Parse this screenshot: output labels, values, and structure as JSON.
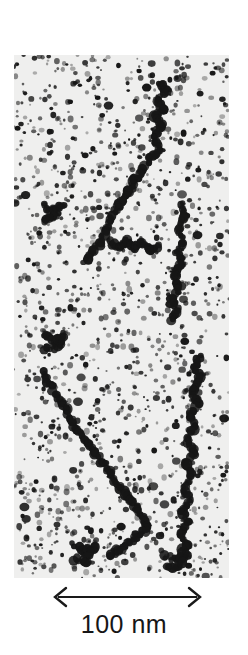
{
  "figure": {
    "kind": "electron-micrograph",
    "panel": {
      "x": 14,
      "y": 55,
      "width": 215,
      "height": 523,
      "background_color": "#efefee",
      "particle_color": "#161616"
    }
  },
  "scale_bar": {
    "label": "100 nm",
    "length_px": 155,
    "arrow_style": "double-headed",
    "color": "#1a1a1a",
    "x": 50,
    "y": 584
  },
  "chart_data": {
    "type": "scatter",
    "title": "",
    "xlabel": "",
    "ylabel": "",
    "grid": false,
    "legend": false,
    "scale_bar_label": "100 nm",
    "scale_bar_length_px": 155,
    "panel_width_px": 215,
    "panel_height_px": 523,
    "nm_per_px": 0.645,
    "filaments": [
      {
        "name": "filament-upper-right",
        "points": [
          [
            145,
            28
          ],
          [
            152,
            36
          ],
          [
            143,
            45
          ],
          [
            150,
            54
          ],
          [
            141,
            62
          ],
          [
            148,
            72
          ],
          [
            139,
            83
          ],
          [
            146,
            94
          ],
          [
            136,
            104
          ],
          [
            128,
            116
          ],
          [
            120,
            128
          ],
          [
            112,
            140
          ],
          [
            104,
            152
          ],
          [
            98,
            164
          ],
          [
            92,
            176
          ],
          [
            86,
            188
          ],
          [
            78,
            198
          ],
          [
            70,
            208
          ]
        ]
      },
      {
        "name": "filament-mid-right",
        "points": [
          [
            168,
            150
          ],
          [
            172,
            162
          ],
          [
            165,
            174
          ],
          [
            170,
            186
          ],
          [
            163,
            198
          ],
          [
            168,
            210
          ],
          [
            160,
            220
          ],
          [
            166,
            232
          ],
          [
            158,
            244
          ],
          [
            164,
            256
          ],
          [
            156,
            266
          ]
        ]
      },
      {
        "name": "filament-lower-left",
        "points": [
          [
            28,
            318
          ],
          [
            36,
            330
          ],
          [
            44,
            342
          ],
          [
            52,
            354
          ],
          [
            58,
            366
          ],
          [
            66,
            378
          ],
          [
            74,
            388
          ],
          [
            82,
            398
          ],
          [
            90,
            410
          ],
          [
            98,
            420
          ],
          [
            106,
            432
          ],
          [
            114,
            442
          ],
          [
            122,
            452
          ],
          [
            128,
            462
          ],
          [
            134,
            472
          ],
          [
            126,
            480
          ],
          [
            116,
            488
          ],
          [
            106,
            494
          ],
          [
            96,
            500
          ]
        ]
      },
      {
        "name": "filament-lower-right",
        "points": [
          [
            186,
            300
          ],
          [
            180,
            312
          ],
          [
            186,
            324
          ],
          [
            178,
            336
          ],
          [
            184,
            348
          ],
          [
            176,
            360
          ],
          [
            182,
            372
          ],
          [
            174,
            384
          ],
          [
            180,
            396
          ],
          [
            172,
            408
          ],
          [
            178,
            420
          ],
          [
            170,
            432
          ],
          [
            176,
            444
          ],
          [
            168,
            456
          ],
          [
            174,
            468
          ],
          [
            166,
            478
          ],
          [
            172,
            490
          ],
          [
            164,
            500
          ]
        ]
      },
      {
        "name": "filament-center-short",
        "points": [
          [
            96,
            186
          ],
          [
            104,
            192
          ],
          [
            112,
            186
          ],
          [
            120,
            194
          ],
          [
            128,
            188
          ],
          [
            136,
            196
          ],
          [
            144,
            190
          ]
        ]
      },
      {
        "name": "cluster-left-mid",
        "points": [
          [
            30,
            150
          ],
          [
            40,
            156
          ],
          [
            48,
            150
          ],
          [
            40,
            162
          ],
          [
            30,
            166
          ]
        ]
      },
      {
        "name": "cluster-left-lower",
        "points": [
          [
            30,
            280
          ],
          [
            40,
            286
          ],
          [
            50,
            280
          ],
          [
            44,
            292
          ],
          [
            32,
            294
          ]
        ]
      },
      {
        "name": "cluster-bottom-left",
        "points": [
          [
            60,
            490
          ],
          [
            70,
            498
          ],
          [
            80,
            492
          ],
          [
            72,
            506
          ],
          [
            60,
            504
          ]
        ]
      },
      {
        "name": "cluster-bottom-right",
        "points": [
          [
            150,
            500
          ],
          [
            162,
            506
          ],
          [
            172,
            500
          ],
          [
            164,
            514
          ],
          [
            152,
            512
          ]
        ]
      }
    ],
    "background_particle_count": 1400,
    "particle_radius_range_px": [
      0.9,
      3.0
    ]
  }
}
